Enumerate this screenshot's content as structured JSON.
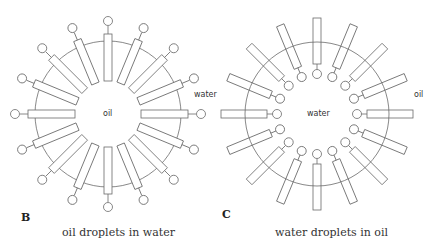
{
  "panels": [
    {
      "letter": "B",
      "caption": "oil droplets in water",
      "inner_label": "oil",
      "outer_label": "water",
      "type": "micelle",
      "center": [
        108,
        114
      ],
      "radius": 73,
      "molecule_count": 16
    },
    {
      "letter": "C",
      "caption": "water droplets in oil",
      "inner_label": "water",
      "outer_label": "oil",
      "type": "reverse-micelle",
      "center": [
        317,
        114
      ],
      "radius": 72,
      "molecule_count": 16
    }
  ],
  "colors": {
    "line": "#6a6a6a",
    "text": "#333333"
  }
}
